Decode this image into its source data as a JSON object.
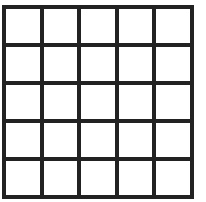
{
  "grid": {
    "rows": 5,
    "columns": 5,
    "line_color": "#222222",
    "cell_color": "#ffffff",
    "cells": [
      [
        "",
        "",
        "",
        "",
        ""
      ],
      [
        "",
        "",
        "",
        "",
        ""
      ],
      [
        "",
        "",
        "",
        "",
        ""
      ],
      [
        "",
        "",
        "",
        "",
        ""
      ],
      [
        "",
        "",
        "",
        "",
        ""
      ]
    ]
  }
}
